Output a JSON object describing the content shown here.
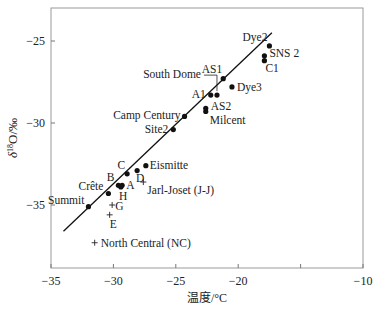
{
  "chart_data": {
    "type": "scatter",
    "title": "",
    "xlabel": "温度/°C",
    "ylabel": "δ18O/‰",
    "xlim": [
      -35,
      -10
    ],
    "ylim": [
      -39.3,
      -23.4
    ],
    "xticks": [
      -35,
      -30,
      -25,
      -20,
      -15,
      -10
    ],
    "xtick_labels": [
      "−35",
      "−30",
      "−25",
      "−20",
      "",
      "−10"
    ],
    "yticks": [
      -25,
      -30,
      -35
    ],
    "ytick_labels": [
      "−25",
      "−30",
      "−35"
    ],
    "grid": false,
    "regression_line": {
      "x": [
        -34,
        -17.3
      ],
      "y": [
        -36.6,
        -24.5
      ]
    },
    "series": [
      {
        "name": "sites-dot",
        "marker": "dot",
        "points": [
          {
            "label": "Summit",
            "x": -32.0,
            "y": -35.1
          },
          {
            "label": "Crête",
            "x": -30.4,
            "y": -34.3
          },
          {
            "label": "B",
            "x": -29.6,
            "y": -33.8
          },
          {
            "label": "A",
            "x": -29.3,
            "y": -33.8
          },
          {
            "label": "H",
            "x": -29.4,
            "y": -33.9
          },
          {
            "label": "C",
            "x": -28.9,
            "y": -33.1
          },
          {
            "label": "D",
            "x": -28.1,
            "y": -32.9
          },
          {
            "label": "Eismitte",
            "x": -27.4,
            "y": -32.6
          },
          {
            "label": "Site2",
            "x": -25.2,
            "y": -30.4
          },
          {
            "label": "Camp Century",
            "x": -24.3,
            "y": -29.6
          },
          {
            "label": "Milcent",
            "x": -22.6,
            "y": -29.3
          },
          {
            "label": "AS2",
            "x": -22.6,
            "y": -29.1
          },
          {
            "label": "A1",
            "x": -22.2,
            "y": -28.3
          },
          {
            "label": "South Dome",
            "x": -21.7,
            "y": -28.3
          },
          {
            "label": "AS1",
            "x": -21.2,
            "y": -27.3
          },
          {
            "label": "Dye3",
            "x": -20.5,
            "y": -27.8
          },
          {
            "label": "SNS 2",
            "x": -17.9,
            "y": -25.9
          },
          {
            "label": "C1",
            "x": -17.9,
            "y": -26.2
          },
          {
            "label": "Dye2",
            "x": -17.5,
            "y": -25.3
          }
        ]
      },
      {
        "name": "sites-cross",
        "marker": "plus",
        "points": [
          {
            "label": "Jarl-Joset (J-J)",
            "x": -27.6,
            "y": -33.6
          },
          {
            "label": "G",
            "x": -30.1,
            "y": -35.0
          },
          {
            "label": "E",
            "x": -30.3,
            "y": -35.6
          },
          {
            "label": "North Central (NC)",
            "x": -31.5,
            "y": -37.3
          }
        ]
      }
    ]
  }
}
